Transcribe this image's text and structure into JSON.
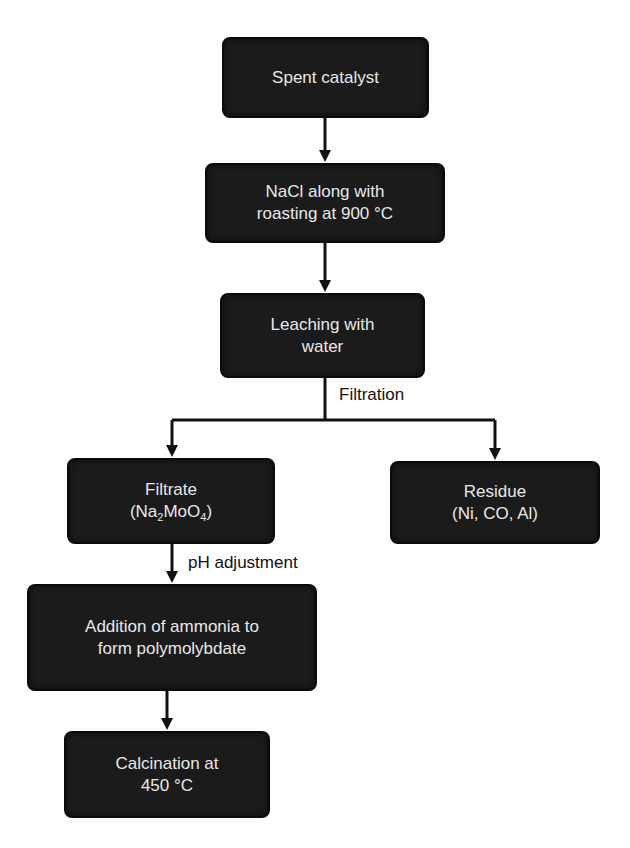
{
  "diagram": {
    "type": "flowchart",
    "nodes": [
      {
        "id": "spent-catalyst",
        "lines": [
          "Spent catalyst"
        ]
      },
      {
        "id": "nacl-roasting",
        "lines": [
          "NaCl along with",
          "roasting at 900 °C"
        ]
      },
      {
        "id": "leaching",
        "lines": [
          "Leaching with",
          "water"
        ]
      },
      {
        "id": "filtrate",
        "lines": [
          "Filtrate"
        ],
        "formula": {
          "open": "(Na",
          "sub1": "2",
          "mid": "MoO",
          "sub2": "4",
          "close": ")"
        }
      },
      {
        "id": "residue",
        "lines": [
          "Residue",
          "(Ni, CO, Al)"
        ]
      },
      {
        "id": "ammonia",
        "lines": [
          "Addition of ammonia to",
          "form polymolybdate"
        ]
      },
      {
        "id": "calcination",
        "lines": [
          "Calcination at",
          "450 °C"
        ]
      }
    ],
    "edge_labels": {
      "filtration": "Filtration",
      "ph_adjustment": "pH adjustment"
    },
    "edges": [
      {
        "from": "spent-catalyst",
        "to": "nacl-roasting"
      },
      {
        "from": "nacl-roasting",
        "to": "leaching"
      },
      {
        "from": "leaching",
        "to": "filtrate",
        "label": "Filtration"
      },
      {
        "from": "leaching",
        "to": "residue",
        "label": "Filtration"
      },
      {
        "from": "filtrate",
        "to": "ammonia",
        "label": "pH adjustment"
      },
      {
        "from": "ammonia",
        "to": "calcination"
      }
    ],
    "colors": {
      "box_fill": "#1b1b1b",
      "box_text": "#e8e8e8",
      "line": "#111111"
    }
  }
}
